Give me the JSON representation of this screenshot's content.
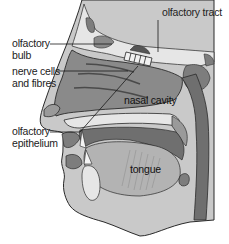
{
  "diagram": {
    "labels": {
      "olfactory_tract": "olfactory tract",
      "olfactory_bulb_line1": "olfactory",
      "olfactory_bulb_line2": "bulb",
      "nerve_cells_line1": "nerve cells",
      "nerve_cells_line2": "and fibres",
      "nasal_cavity": "nasal cavity",
      "olfactory_epithelium_line1": "olfactory",
      "olfactory_epithelium_line2": "epithelium",
      "tongue": "tongue"
    },
    "colors": {
      "background": "#ffffff",
      "skin": "#c9c9c9",
      "cavity": "#8a8a8a",
      "tissue_dark": "#6f6f6f",
      "bone": "#e6e6e6",
      "brain": "#dcdcdc",
      "outline": "#2a2a2a",
      "leader_line": "#1a1a1a"
    }
  }
}
